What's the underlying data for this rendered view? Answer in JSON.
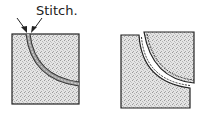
{
  "diagram": {
    "annotation": {
      "label": "Stitch."
    },
    "panels": [
      {
        "name": "left-panel",
        "description": "Square fabric with curved stitched seam from top edge to right edge"
      },
      {
        "name": "right-panel",
        "description": "Seam opened: L-shaped piece and quarter-circle piece separated, showing stitching lines along curve"
      }
    ],
    "colors": {
      "fabric": "#d9d9d9",
      "outline": "#222222",
      "seam": "#888888",
      "background": "#ffffff"
    }
  }
}
